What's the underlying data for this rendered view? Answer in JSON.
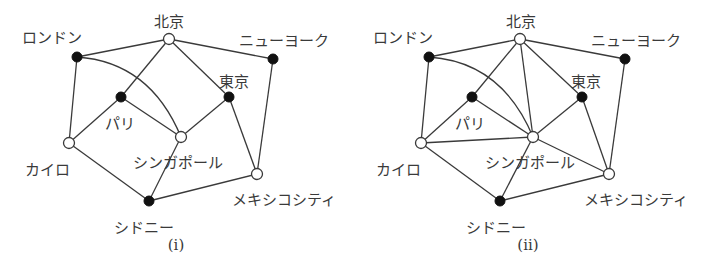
{
  "figure": {
    "colors": {
      "line": "#3a3a3a",
      "filled_node": "#111111",
      "open_node": "#ffffff"
    },
    "panels": [
      {
        "id": "i",
        "caption": "(i)",
        "caption_pos": [
          176,
          250
        ],
        "nodes": [
          {
            "id": "beijing",
            "label": "北京",
            "x": 169,
            "y": 39,
            "fill": "open",
            "lx": 169,
            "ly": 22,
            "anchor": "middle"
          },
          {
            "id": "london",
            "label": "ロンドン",
            "x": 77,
            "y": 57,
            "fill": "filled",
            "lx": 52,
            "ly": 38,
            "anchor": "middle"
          },
          {
            "id": "newyork",
            "label": "ニューヨーク",
            "x": 273,
            "y": 59,
            "fill": "filled",
            "lx": 284,
            "ly": 41,
            "anchor": "middle"
          },
          {
            "id": "paris",
            "label": "パリ",
            "x": 121,
            "y": 97,
            "fill": "filled",
            "lx": 120,
            "ly": 124,
            "anchor": "middle"
          },
          {
            "id": "tokyo",
            "label": "東京",
            "x": 229,
            "y": 97,
            "fill": "filled",
            "lx": 234,
            "ly": 82,
            "anchor": "middle"
          },
          {
            "id": "singapore",
            "label": "シンガポール",
            "x": 181,
            "y": 137,
            "fill": "open",
            "lx": 178,
            "ly": 163,
            "anchor": "middle"
          },
          {
            "id": "cairo",
            "label": "カイロ",
            "x": 69,
            "y": 143,
            "fill": "open",
            "lx": 47,
            "ly": 170,
            "anchor": "middle"
          },
          {
            "id": "mexico",
            "label": "メキシコシティ",
            "x": 257,
            "y": 174,
            "fill": "open",
            "lx": 284,
            "ly": 200,
            "anchor": "middle"
          },
          {
            "id": "sydney",
            "label": "シドニー",
            "x": 149,
            "y": 201,
            "fill": "filled",
            "lx": 144,
            "ly": 228,
            "anchor": "middle"
          }
        ],
        "edges": [
          [
            "beijing",
            "london"
          ],
          [
            "beijing",
            "newyork"
          ],
          [
            "beijing",
            "paris"
          ],
          [
            "beijing",
            "tokyo"
          ],
          [
            "london",
            "cairo"
          ],
          [
            "newyork",
            "mexico"
          ],
          [
            "paris",
            "cairo"
          ],
          [
            "paris",
            "singapore"
          ],
          [
            "tokyo",
            "singapore"
          ],
          [
            "tokyo",
            "mexico"
          ],
          [
            "cairo",
            "sydney"
          ],
          [
            "singapore",
            "sydney"
          ],
          [
            "sydney",
            "mexico"
          ]
        ],
        "curved_edges": [
          {
            "from": "london",
            "to": "singapore",
            "control": [
              150,
              62
            ]
          }
        ]
      },
      {
        "id": "ii",
        "caption": "(ii)",
        "caption_pos": [
          528,
          250
        ],
        "nodes": [
          {
            "id": "beijing",
            "label": "北京",
            "x": 520,
            "y": 39,
            "fill": "open",
            "lx": 521,
            "ly": 22,
            "anchor": "middle"
          },
          {
            "id": "london",
            "label": "ロンドン",
            "x": 429,
            "y": 57,
            "fill": "filled",
            "lx": 403,
            "ly": 38,
            "anchor": "middle"
          },
          {
            "id": "newyork",
            "label": "ニューヨーク",
            "x": 625,
            "y": 59,
            "fill": "filled",
            "lx": 636,
            "ly": 41,
            "anchor": "middle"
          },
          {
            "id": "paris",
            "label": "パリ",
            "x": 472,
            "y": 97,
            "fill": "filled",
            "lx": 470,
            "ly": 124,
            "anchor": "middle"
          },
          {
            "id": "tokyo",
            "label": "東京",
            "x": 582,
            "y": 97,
            "fill": "filled",
            "lx": 586,
            "ly": 82,
            "anchor": "middle"
          },
          {
            "id": "singapore",
            "label": "シンガポール",
            "x": 533,
            "y": 137,
            "fill": "open",
            "lx": 530,
            "ly": 163,
            "anchor": "middle"
          },
          {
            "id": "cairo",
            "label": "カイロ",
            "x": 421,
            "y": 143,
            "fill": "open",
            "lx": 398,
            "ly": 170,
            "anchor": "middle"
          },
          {
            "id": "mexico",
            "label": "メキシコシティ",
            "x": 609,
            "y": 174,
            "fill": "open",
            "lx": 636,
            "ly": 200,
            "anchor": "middle"
          },
          {
            "id": "sydney",
            "label": "シドニー",
            "x": 500,
            "y": 201,
            "fill": "filled",
            "lx": 496,
            "ly": 228,
            "anchor": "middle"
          }
        ],
        "edges": [
          [
            "beijing",
            "london"
          ],
          [
            "beijing",
            "newyork"
          ],
          [
            "beijing",
            "paris"
          ],
          [
            "beijing",
            "tokyo"
          ],
          [
            "beijing",
            "singapore"
          ],
          [
            "london",
            "cairo"
          ],
          [
            "newyork",
            "mexico"
          ],
          [
            "paris",
            "cairo"
          ],
          [
            "paris",
            "singapore"
          ],
          [
            "tokyo",
            "singapore"
          ],
          [
            "tokyo",
            "mexico"
          ],
          [
            "cairo",
            "sydney"
          ],
          [
            "cairo",
            "singapore"
          ],
          [
            "singapore",
            "sydney"
          ],
          [
            "singapore",
            "mexico"
          ],
          [
            "sydney",
            "mexico"
          ]
        ],
        "curved_edges": [
          {
            "from": "london",
            "to": "singapore",
            "control": [
              502,
              62
            ]
          }
        ]
      }
    ]
  }
}
